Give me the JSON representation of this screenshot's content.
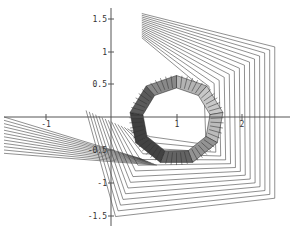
{
  "chart_data": {
    "type": "line",
    "title": "",
    "xlabel": "",
    "ylabel": "",
    "xlim": [
      -1.7,
      2.8
    ],
    "ylim": [
      -1.65,
      1.75
    ],
    "grid": false,
    "x_ticks": [
      -1,
      1,
      2
    ],
    "x_tick_labels": [
      "-1",
      "1",
      "2"
    ],
    "y_ticks": [
      1.5,
      1,
      0.5,
      -0.5,
      -1,
      -1.5
    ],
    "y_tick_labels": [
      "1.5",
      "1",
      "0.5",
      "-0.5",
      "-1",
      "-1.5"
    ],
    "series": [
      {
        "name": "outer frame (nested line family)",
        "outer_vertices": [
          [
            0.47,
            1.58
          ],
          [
            2.5,
            1.07
          ],
          [
            2.5,
            -1.24
          ],
          [
            0.07,
            -1.52
          ],
          [
            -0.38,
            0.1
          ]
        ],
        "inner_vertices": [
          [
            0.47,
            1.21
          ],
          [
            1.42,
            0.42
          ],
          [
            1.45,
            -0.42
          ],
          [
            0.6,
            -0.3
          ],
          [
            0.3,
            -0.2
          ]
        ],
        "line_count": 14
      },
      {
        "name": "left fan (line family)",
        "from_x": -1.7,
        "to_point": [
          0.45,
          -0.68
        ],
        "line_count": 12
      },
      {
        "name": "tube ring",
        "center": [
          1.0,
          -0.05
        ],
        "outer_radius": 0.72,
        "inner_radius": 0.52,
        "sides": 9
      }
    ]
  },
  "axes": {
    "x_ticks": [
      {
        "label": "-1",
        "px": 46
      },
      {
        "label": "1",
        "px": 177
      },
      {
        "label": "2",
        "px": 242
      }
    ],
    "y_ticks": [
      {
        "label": "1.5",
        "py": 19
      },
      {
        "label": "1",
        "py": 52
      },
      {
        "label": "0.5",
        "py": 84
      },
      {
        "label": "-0.5",
        "py": 150
      },
      {
        "label": "-1",
        "py": 183
      },
      {
        "label": "-1.5",
        "py": 216
      }
    ]
  }
}
